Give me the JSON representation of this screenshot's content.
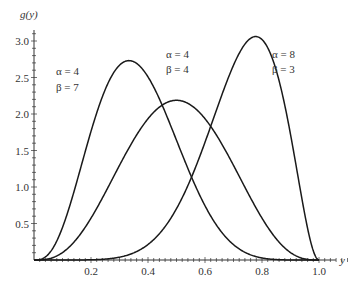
{
  "chart_data": {
    "type": "line",
    "title": "",
    "xlabel": "y",
    "ylabel": "g(y)",
    "xlim": [
      0,
      1.0
    ],
    "ylim": [
      0,
      3.2
    ],
    "grid": false,
    "legend": "none",
    "x_ticks": [
      "0.2",
      "0.4",
      "0.6",
      "0.8",
      "1.0"
    ],
    "y_ticks": [
      "0.5",
      "1.0",
      "1.5",
      "2.0",
      "2.5",
      "3.0"
    ],
    "series": [
      {
        "name": "α = 4, β = 7",
        "alpha": 4,
        "beta": 7,
        "peak_x": 0.3,
        "peak_y": 2.94
      },
      {
        "name": "α = 4, β = 4",
        "alpha": 4,
        "beta": 4,
        "peak_x": 0.5,
        "peak_y": 2.19
      },
      {
        "name": "α = 8, β = 3",
        "alpha": 8,
        "beta": 3,
        "peak_x": 0.778,
        "peak_y": 3.16
      }
    ],
    "annotations": [
      {
        "line1": "α = 4",
        "line2": "β = 7"
      },
      {
        "line1": "α = 4",
        "line2": "β = 4"
      },
      {
        "line1": "α = 8",
        "line2": "β = 3"
      }
    ]
  }
}
